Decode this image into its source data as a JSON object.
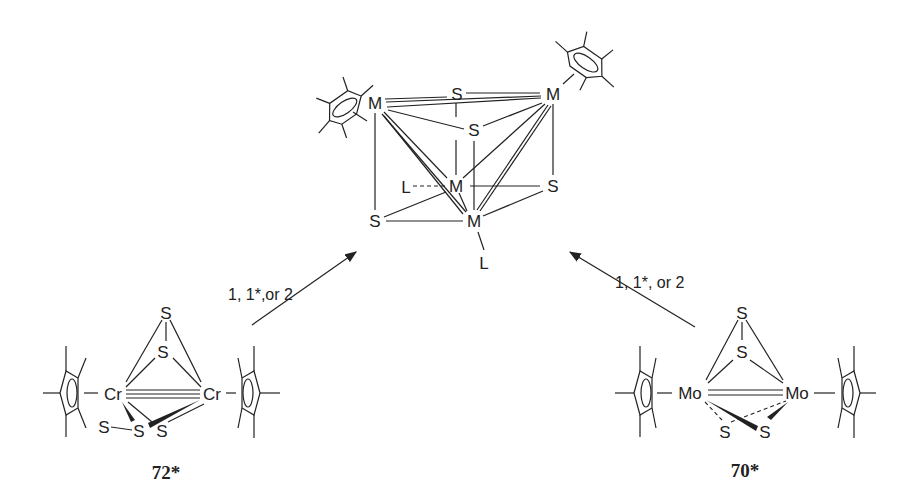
{
  "diagram": {
    "type": "reaction-scheme",
    "product": {
      "description": "M4S4 cubane cluster with two Cp* and two L ligands",
      "atoms": {
        "m_top_left": "M",
        "m_top_right": "M",
        "s_top": "S",
        "s_mid": "S",
        "m_center": "M",
        "s_right": "S",
        "s_bottom_left": "S",
        "m_bottom": "M",
        "l_left": "L",
        "l_bottom": "L"
      }
    },
    "arrows": [
      {
        "label": "1, 1*,or 2",
        "direction": "left-reactant-to-product"
      },
      {
        "label": "1, 1*, or 2",
        "direction": "right-reactant-to-product"
      }
    ],
    "reactants": [
      {
        "id": "72*",
        "label": "72*",
        "atoms": {
          "s_top": "S",
          "s_upper": "S",
          "metal_left": "Cr",
          "metal_right": "Cr",
          "s_low1": "S",
          "s_low2": "S",
          "s_low3": "S"
        }
      },
      {
        "id": "70*",
        "label": "70*",
        "atoms": {
          "s_top": "S",
          "s_upper": "S",
          "metal_left": "Mo",
          "metal_right": "Mo",
          "s_low1": "S",
          "s_low2": "S"
        }
      }
    ]
  }
}
